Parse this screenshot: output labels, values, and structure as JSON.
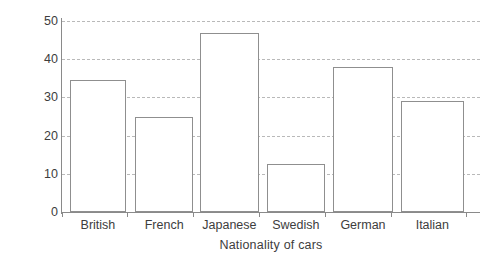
{
  "chart_data": {
    "type": "bar",
    "title": "",
    "xlabel": "Nationality of cars",
    "ylabel": "Number of cars",
    "categories": [
      "British",
      "French",
      "Japanese",
      "Swedish",
      "German",
      "Italian"
    ],
    "values": [
      34.5,
      25,
      46.8,
      12.5,
      38,
      29
    ],
    "ylim": [
      0,
      50
    ],
    "ytick_values": [
      0,
      10,
      20,
      30,
      40,
      50
    ],
    "ytick_labels": [
      "0",
      "10",
      "20",
      "30",
      "40",
      "50"
    ],
    "grid": true,
    "grid_style": "dashed",
    "grid_axis": "y",
    "legend": null,
    "series": [
      {
        "name": "Number of cars",
        "values": [
          34.5,
          25,
          46.8,
          12.5,
          38,
          29
        ]
      }
    ],
    "colors": {
      "bar_fill": "#ffffff",
      "bar_stroke": "#8f8f8f",
      "gridline": "#b9b9b9",
      "axis": "#8a8a8a",
      "text": "#3d3d3d",
      "background": "#ffffff"
    },
    "bar_geometry": [
      {
        "category": "British",
        "left_pct": 1.9,
        "width_pct": 13.4
      },
      {
        "category": "French",
        "left_pct": 17.5,
        "width_pct": 13.9
      },
      {
        "category": "Japanese",
        "left_pct": 33.0,
        "width_pct": 14.1
      },
      {
        "category": "Swedish",
        "left_pct": 49.0,
        "width_pct": 13.9
      },
      {
        "category": "German",
        "left_pct": 64.8,
        "width_pct": 14.4
      },
      {
        "category": "Italian",
        "left_pct": 81.1,
        "width_pct": 15.0
      }
    ],
    "x_tick_positions_pct": [
      0.0,
      15.6,
      31.4,
      47.1,
      62.9,
      78.7,
      96.7
    ]
  }
}
